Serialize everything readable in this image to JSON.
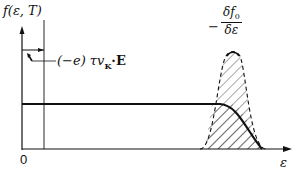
{
  "diagram": {
    "y_axis_label": "f(ε, T)",
    "x_axis_label": "ε",
    "origin_label": "0",
    "shift_label": "(−e) τv",
    "shift_label_sub": "K",
    "shift_label_tail": "·E",
    "derivative_label_minus": "−",
    "derivative_label_num": "δf",
    "derivative_label_num_sub": "0",
    "derivative_label_den": "δε",
    "curves": [
      {
        "name": "equilibrium-fermi-function",
        "style": "solid-thick"
      },
      {
        "name": "shifted-distribution",
        "style": "thin"
      },
      {
        "name": "negative-derivative-peak",
        "style": "dashed",
        "fill": "hatched"
      }
    ],
    "colors": {
      "ink": "#111111",
      "background": "#ffffff"
    }
  }
}
